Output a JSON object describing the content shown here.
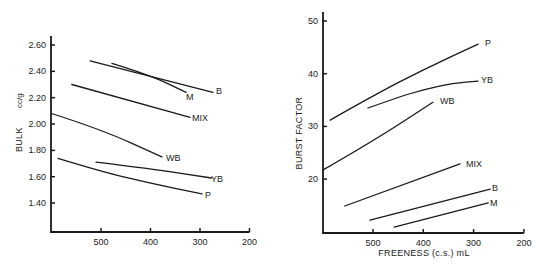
{
  "chart_data": [
    {
      "type": "line",
      "title": "",
      "xlabel": "",
      "ylabel": "BULK",
      "ylabel_unit": "cc/g",
      "x_reversed": true,
      "xlim": [
        600,
        200
      ],
      "ylim": [
        1.2,
        2.68
      ],
      "x_ticks": [
        500,
        400,
        300,
        200
      ],
      "x_tick_labels": [
        "500",
        "400",
        "300",
        "200"
      ],
      "y_ticks": [
        2.6,
        2.4,
        2.2,
        2.0,
        1.8,
        1.6,
        1.4
      ],
      "y_tick_labels": [
        "2.60",
        "2.40",
        "2.20",
        "2.00",
        "1.80",
        "1.60",
        "1.40"
      ],
      "grid": false,
      "legend": "inline labels at line ends",
      "series": [
        {
          "name": "B",
          "x": [
            522,
            274
          ],
          "y": [
            2.48,
            2.24
          ]
        },
        {
          "name": "M",
          "x": [
            478,
            400,
            328
          ],
          "y": [
            2.46,
            2.37,
            2.24
          ]
        },
        {
          "name": "MIX",
          "x": [
            559,
            320
          ],
          "y": [
            2.3,
            2.05
          ]
        },
        {
          "name": "WB",
          "x": [
            600,
            500,
            377
          ],
          "y": [
            2.08,
            1.96,
            1.75
          ]
        },
        {
          "name": "YB",
          "x": [
            510,
            400,
            277
          ],
          "y": [
            1.71,
            1.66,
            1.59
          ]
        },
        {
          "name": "P",
          "x": [
            587,
            500,
            400,
            296
          ],
          "y": [
            1.74,
            1.64,
            1.55,
            1.47
          ]
        }
      ]
    },
    {
      "type": "line",
      "title": "",
      "xlabel": "FREENESS (c.s.) mL",
      "ylabel": "BURST FACTOR",
      "x_reversed": true,
      "xlim": [
        600,
        200
      ],
      "ylim": [
        10,
        52
      ],
      "x_ticks": [
        500,
        400,
        300,
        200
      ],
      "x_tick_labels": [
        "500",
        "400",
        "300",
        "200"
      ],
      "y_ticks": [
        50,
        40,
        30,
        20
      ],
      "y_tick_labels": [
        "50",
        "40",
        "30",
        "20"
      ],
      "grid": false,
      "legend": "inline labels at line ends",
      "series": [
        {
          "name": "P",
          "x": [
            585,
            500,
            400,
            291
          ],
          "y": [
            31.2,
            35.8,
            40.8,
            45.6
          ]
        },
        {
          "name": "YB",
          "x": [
            510,
            450,
            400,
            340,
            291
          ],
          "y": [
            33.5,
            35.5,
            37.0,
            38.2,
            38.6
          ]
        },
        {
          "name": "WB",
          "x": [
            600,
            500,
            381
          ],
          "y": [
            21.7,
            27.2,
            34.6
          ]
        },
        {
          "name": "MIX",
          "x": [
            556,
            327
          ],
          "y": [
            14.9,
            22.9
          ]
        },
        {
          "name": "B",
          "x": [
            506,
            267
          ],
          "y": [
            12.2,
            18.1
          ]
        },
        {
          "name": "M",
          "x": [
            458,
            271
          ],
          "y": [
            10.9,
            15.5
          ]
        }
      ]
    }
  ],
  "layout": [
    {
      "x0": 51,
      "x_at_500": 101,
      "px_per_100": 49.5,
      "y_axis_top": 36,
      "y_axis_bottom": 232,
      "y_ref_value": 2.6,
      "y_ref_px": 45,
      "px_per_unit": 131.7,
      "tick_value_500": 500
    },
    {
      "x0": 323,
      "x_at_500": 373,
      "px_per_100": 50.3,
      "y_axis_top": 12,
      "y_axis_bottom": 233,
      "y_ref_value": 50,
      "y_ref_px": 21,
      "px_per_unit": 5.27,
      "tick_value_500": 500
    }
  ],
  "labels": {
    "left": {
      "ylabel": "BULK",
      "ylabel_unit": "cc/g",
      "series_label_pos": {
        "B": [
          216,
          94
        ],
        "M": [
          186,
          100
        ],
        "MIX": [
          192,
          121
        ],
        "WB": [
          166,
          161
        ],
        "YB": [
          211,
          182
        ],
        "P": [
          205,
          198
        ]
      }
    },
    "right": {
      "ylabel": "BURST FACTOR",
      "xlabel": "FREENESS (c.s.) mL",
      "series_label_pos": {
        "P": [
          485,
          46
        ],
        "YB": [
          481,
          83
        ],
        "WB": [
          440,
          104
        ],
        "MIX": [
          466,
          167
        ],
        "B": [
          492,
          191
        ],
        "M": [
          490,
          206
        ]
      }
    }
  }
}
